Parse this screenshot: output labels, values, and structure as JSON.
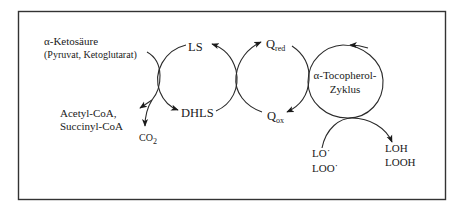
{
  "diagram": {
    "colors": {
      "border": "#333333",
      "line": "#2a2a2a",
      "text": "#1a1a1a",
      "background": "#ffffff"
    },
    "input": {
      "line1": "α-Ketosäure",
      "line2": "(Pyruvat, Ketoglutarat)"
    },
    "products": {
      "line1": "Acetyl-CoA,",
      "line2": "Succinyl-CoA"
    },
    "co2": {
      "main": "CO",
      "sub": "2"
    },
    "lipoate_cycle": {
      "top": "LS",
      "bottom": "DHLS"
    },
    "quinone_cycle": {
      "top": {
        "main": "Q",
        "sub": "red"
      },
      "bottom": {
        "main": "Q",
        "sub": "ox"
      }
    },
    "tocopherol_cycle": {
      "line1": "α-Tocopherol-",
      "line2": "Zyklus"
    },
    "radicals": {
      "line1": "LO˙",
      "line2": "LOO˙"
    },
    "reduced": {
      "line1": "LOH",
      "line2": "LOOH"
    }
  }
}
